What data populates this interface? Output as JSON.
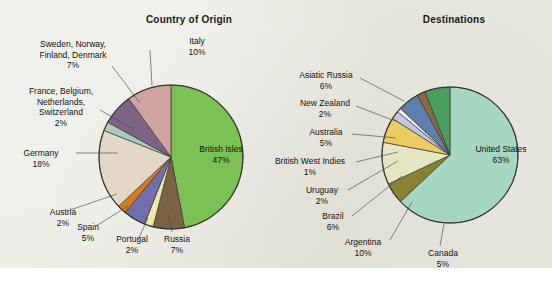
{
  "figure": {
    "background_color": "#e9e9e0",
    "charts": [
      {
        "title": "Country of Origin"
      },
      {
        "title": "Destinations"
      }
    ]
  },
  "chart_data": [
    {
      "type": "pie",
      "title": "Country of Origin",
      "unit": "%",
      "legend_position": "callout-labels",
      "categories": [
        "British Isles",
        "Russia",
        "Portugal",
        "Spain",
        "Austria",
        "Germany",
        "France, Belgium, Netherlands, Switzerland",
        "Sweden, Norway, Finland, Denmark",
        "Italy"
      ],
      "values": [
        47,
        7,
        2,
        5,
        2,
        18,
        2,
        7,
        10
      ],
      "colors": [
        "#7cc153",
        "#7a6344",
        "#f2e9a8",
        "#6f6fae",
        "#d97a1e",
        "#e3d8c8",
        "#a9ccbd",
        "#7d6384",
        "#cfa4a0"
      ],
      "labels": [
        {
          "name": "British Isles",
          "pct": "47%"
        },
        {
          "name": "Russia",
          "pct": "7%"
        },
        {
          "name": "Portugal",
          "pct": "2%"
        },
        {
          "name": "Spain",
          "pct": "5%"
        },
        {
          "name": "Austria",
          "pct": "2%"
        },
        {
          "name": "Germany",
          "pct": "18%"
        },
        {
          "name": "France, Belgium,",
          "name2": "Netherlands,",
          "name3": "Switzerland",
          "pct": "2%"
        },
        {
          "name": "Sweden, Norway,",
          "name2": "Finland, Denmark",
          "pct": "7%"
        },
        {
          "name": "Italy",
          "pct": "10%"
        }
      ]
    },
    {
      "type": "pie",
      "title": "Destinations",
      "unit": "%",
      "legend_position": "callout-labels",
      "categories": [
        "United States",
        "Canada",
        "Argentina",
        "Brazil",
        "Uruguay",
        "British West Indies",
        "Australia",
        "New Zealand",
        "Asiatic Russia"
      ],
      "values": [
        63,
        5,
        10,
        6,
        2,
        1,
        5,
        2,
        6
      ],
      "colors": [
        "#a4d6c2",
        "#8a8233",
        "#e5e7c4",
        "#eccb63",
        "#c3c6e2",
        "#eef0f2",
        "#5f7fae",
        "#8a6a3f",
        "#4b9d5e"
      ],
      "labels": [
        {
          "name": "United States",
          "pct": "63%"
        },
        {
          "name": "Canada",
          "pct": "5%"
        },
        {
          "name": "Argentina",
          "pct": "10%"
        },
        {
          "name": "Brazil",
          "pct": "6%"
        },
        {
          "name": "Uruguay",
          "pct": "2%"
        },
        {
          "name": "British West Indies",
          "pct": "1%"
        },
        {
          "name": "Australia",
          "pct": "5%"
        },
        {
          "name": "New Zealand",
          "pct": "2%"
        },
        {
          "name": "Asiatic Russia",
          "pct": "6%"
        }
      ]
    }
  ]
}
